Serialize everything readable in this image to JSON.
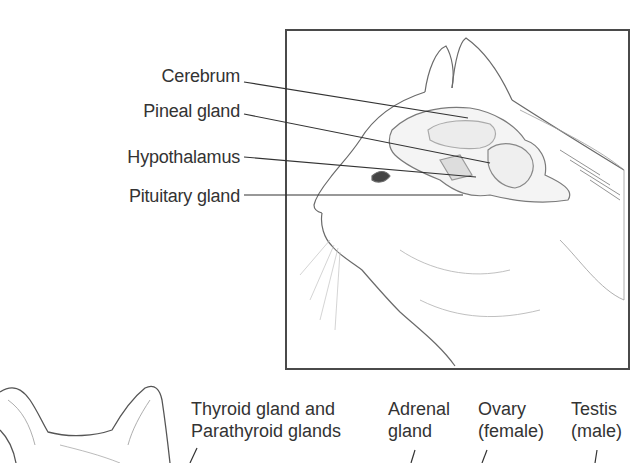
{
  "diagram": {
    "head_panel": {
      "labels": [
        {
          "id": "cerebrum",
          "text": "Cerebrum"
        },
        {
          "id": "pineal",
          "text": "Pineal gland"
        },
        {
          "id": "hypothalamus",
          "text": "Hypothalamus"
        },
        {
          "id": "pituitary",
          "text": "Pituitary gland"
        }
      ]
    },
    "body_panel": {
      "labels": [
        {
          "id": "thyroid",
          "line1": "Thyroid gland and",
          "line2": "Parathyroid glands"
        },
        {
          "id": "adrenal",
          "line1": "Adrenal",
          "line2": "gland"
        },
        {
          "id": "ovary",
          "line1": "Ovary",
          "line2": "(female)"
        },
        {
          "id": "testis",
          "line1": "Testis",
          "line2": "(male)"
        }
      ]
    },
    "colors": {
      "frame": "#4a4a4a",
      "leader": "#333333",
      "sketch": "#6a6a6a",
      "shade": "#bdbdbd"
    }
  }
}
